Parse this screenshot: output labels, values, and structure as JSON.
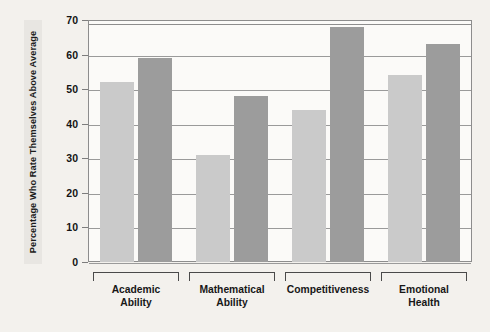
{
  "chart_data": {
    "type": "bar",
    "title": "",
    "subtitle": "",
    "xlabel": "",
    "ylabel": "Percentage Who Rate Themselves Above Average",
    "ylim": [
      0,
      70
    ],
    "yticks": [
      0,
      10,
      20,
      30,
      40,
      50,
      60,
      70
    ],
    "ytick_labels": [
      "0",
      "10",
      "20",
      "30",
      "40",
      "50",
      "60",
      "70"
    ],
    "grid": true,
    "legend": "none",
    "categories": [
      "Academic Ability",
      "Mathematical Ability",
      "Competitiveness",
      "Emotional Health"
    ],
    "category_label_lines": [
      [
        "Academic",
        "Ability"
      ],
      [
        "Mathematical",
        "Ability"
      ],
      [
        "Competitiveness",
        ""
      ],
      [
        "Emotional",
        "Health"
      ]
    ],
    "series": [
      {
        "name": "series-light",
        "color": "#cacaca",
        "values": [
          52,
          31,
          44,
          54
        ]
      },
      {
        "name": "series-dark",
        "color": "#9c9c9c",
        "values": [
          59,
          48,
          68,
          63
        ]
      }
    ],
    "colors": {
      "background": "#f3f1ed",
      "plot_background": "#fbfaf8",
      "axis": "#8d8d8d",
      "gridline": "#9a9a9a",
      "text": "#171717",
      "bar_light": "#cacaca",
      "bar_dark": "#9c9c9c"
    }
  }
}
